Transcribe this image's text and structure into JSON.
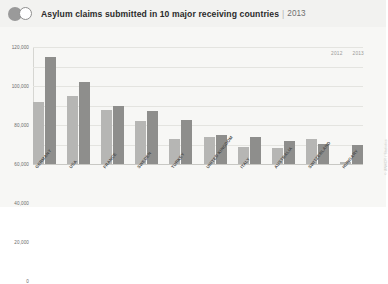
{
  "header": {
    "logo_icon": "two-circles-icon",
    "title": "Asylum claims submitted in 10 major receiving countries",
    "separator": "|",
    "year": "2013"
  },
  "legend": [
    {
      "label": "2012",
      "color": "#b6b6b4"
    },
    {
      "label": "2013",
      "color": "#8e8e8c"
    }
  ],
  "credit": "© UNHCR / Statistics",
  "chart_data": {
    "type": "bar",
    "title": "Asylum claims submitted in 10 major receiving countries",
    "subtitle": "2013",
    "xlabel": "",
    "ylabel": "",
    "ylim": [
      0,
      120000
    ],
    "grid": true,
    "legend_position": "top-right",
    "categories": [
      "GERMANY",
      "USA",
      "FRANCE",
      "SWEDEN",
      "TURKEY",
      "UNITED KINGDOM",
      "ITALY",
      "AUSTRALIA",
      "SWITZERLAND",
      "HUNGARY"
    ],
    "yticks": [
      "0",
      "20,000",
      "40,000",
      "60,000",
      "80,000",
      "100,000",
      "120,000"
    ],
    "ytick_values": [
      0,
      20000,
      40000,
      60000,
      80000,
      100000,
      120000
    ],
    "series": [
      {
        "name": "2012",
        "color": "#b6b6b4",
        "values": [
          64000,
          70000,
          55000,
          44000,
          26000,
          28000,
          17000,
          16000,
          26000,
          2000
        ]
      },
      {
        "name": "2013",
        "color": "#8e8e8c",
        "values": [
          110000,
          84000,
          60000,
          54000,
          45000,
          30000,
          28000,
          24000,
          21000,
          19000
        ]
      }
    ]
  }
}
